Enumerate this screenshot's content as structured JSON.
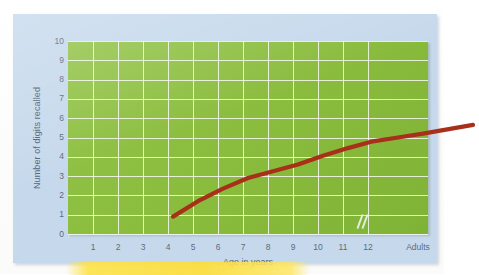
{
  "chart_data": {
    "type": "line",
    "title": "",
    "xlabel": "Age in years",
    "ylabel": "Number of digits recalled",
    "x_categories": [
      "1",
      "2",
      "3",
      "4",
      "5",
      "6",
      "7",
      "8",
      "9",
      "10",
      "11",
      "12",
      "Adults"
    ],
    "x_tick_labels": [
      "1",
      "2",
      "3",
      "4",
      "5",
      "6",
      "7",
      "8",
      "9",
      "10",
      "11",
      "12",
      "Adults"
    ],
    "y_tick_labels": [
      "10",
      "9",
      "8",
      "7",
      "6",
      "5",
      "4",
      "3",
      "2",
      "1",
      "0"
    ],
    "ylim": [
      0,
      10
    ],
    "y_major_step": 1,
    "grid": true,
    "legend": "none",
    "axis_break": "//",
    "series": [
      {
        "name": "Digit span",
        "points": [
          {
            "x": "2",
            "y": 2.3
          },
          {
            "x": "3",
            "y": 3.1
          },
          {
            "x": "4",
            "y": 3.75
          },
          {
            "x": "5",
            "y": 4.3
          },
          {
            "x": "6",
            "y": 4.65
          },
          {
            "x": "7",
            "y": 5.0
          },
          {
            "x": "8",
            "y": 5.45
          },
          {
            "x": "9",
            "y": 5.85
          },
          {
            "x": "10",
            "y": 6.2
          },
          {
            "x": "11",
            "y": 6.4
          },
          {
            "x": "12",
            "y": 6.6
          },
          {
            "x": "Adults",
            "y": 7.05
          }
        ]
      }
    ]
  },
  "colors": {
    "plot_background": "#8cbf3f",
    "panel_background": "#c6d9ec",
    "gridline": "#ffffff",
    "series_line": "#a8301a",
    "tick_text": "#5c6b7d",
    "axis_label_text": "#53637a",
    "highlighter": "#fadd3e"
  }
}
